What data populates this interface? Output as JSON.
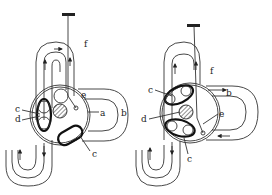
{
  "diagram": {
    "panels": [
      {
        "id": "left",
        "labels": {
          "f": "f",
          "e": "e",
          "c_top": "c",
          "d": "d",
          "a": "a",
          "b": "b",
          "c_bottom": "c"
        }
      },
      {
        "id": "right",
        "labels": {
          "c_top": "c",
          "b": "b",
          "f": "f",
          "d": "d",
          "e": "e",
          "c_bottom": "c"
        }
      }
    ]
  }
}
